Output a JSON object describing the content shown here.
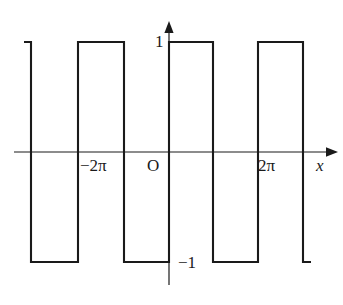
{
  "figure": {
    "title": "",
    "background_color": "#ffffff",
    "stroke_color": "#1a1a1a",
    "axis_color": "#1a1a1a"
  },
  "labels": {
    "y_top": "1",
    "y_bottom": "−1",
    "origin": "O",
    "x_axis": "x",
    "tick_left": "−2π",
    "tick_right": "2π"
  },
  "chart_data": {
    "type": "line",
    "title": "",
    "xlabel": "x",
    "ylabel": "",
    "grid": false,
    "legend": null,
    "xlim": [
      -3.2831853,
      3.7699112
    ],
    "ylim": [
      -1.6,
      1.6
    ],
    "xticks": [
      -6.2831853,
      6.2831853
    ],
    "xticklabels": [
      "−2π",
      "2π"
    ],
    "yticks": [
      -1,
      1
    ],
    "yticklabels": [
      "−1",
      "1"
    ],
    "amplitude": 1,
    "period": 6.2831853,
    "series": [
      {
        "name": "square wave",
        "points_px": [
          {
            "x": 24,
            "y": 42
          },
          {
            "x": 31,
            "y": 42
          },
          {
            "x": 31,
            "y": 262
          },
          {
            "x": 78,
            "y": 262
          },
          {
            "x": 78,
            "y": 42
          },
          {
            "x": 124,
            "y": 42
          },
          {
            "x": 124,
            "y": 262
          },
          {
            "x": 169,
            "y": 262
          },
          {
            "x": 169,
            "y": 42
          },
          {
            "x": 213,
            "y": 42
          },
          {
            "x": 213,
            "y": 262
          },
          {
            "x": 258,
            "y": 262
          },
          {
            "x": 258,
            "y": 42
          },
          {
            "x": 303,
            "y": 42
          },
          {
            "x": 303,
            "y": 262
          },
          {
            "x": 311,
            "y": 262
          }
        ],
        "segments_top_px": [
          [
            24,
            31
          ],
          [
            78,
            124
          ],
          [
            169,
            213
          ],
          [
            258,
            303
          ]
        ],
        "segments_bottom_px": [
          [
            31,
            78
          ],
          [
            124,
            169
          ],
          [
            213,
            258
          ],
          [
            303,
            311
          ]
        ],
        "values": [
          1,
          -1,
          1,
          -1,
          1,
          -1,
          1,
          -1
        ]
      }
    ],
    "axes_px": {
      "x_axis_y": 152,
      "x_axis_x_start": 14,
      "x_axis_x_end": 330,
      "y_axis_x": 169,
      "y_axis_y_start": 26,
      "y_axis_y_end": 285,
      "top_level_y": 42,
      "bottom_level_y": 262
    }
  }
}
